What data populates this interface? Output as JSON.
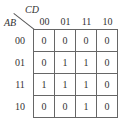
{
  "kmap": {
    "col_var": "CD",
    "row_var": "AB",
    "col_labels": [
      "00",
      "01",
      "11",
      "10"
    ],
    "row_labels": [
      "00",
      "01",
      "11",
      "10"
    ],
    "cells": [
      [
        "0",
        "0",
        "0",
        "0"
      ],
      [
        "0",
        "1",
        "1",
        "0"
      ],
      [
        "1",
        "1",
        "1",
        "0"
      ],
      [
        "0",
        "0",
        "1",
        "0"
      ]
    ]
  }
}
